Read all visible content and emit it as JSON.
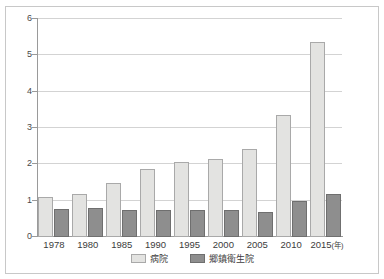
{
  "figure": {
    "title": "",
    "frame_color": "#c8c8c8",
    "background": "#ffffff"
  },
  "legend": {
    "position": "bottom-center",
    "entries": [
      {
        "label": "病院",
        "color": "#e3e3e1"
      },
      {
        "label": "郷鎮衛生院",
        "color": "#8e8e8e"
      }
    ]
  },
  "axis": {
    "y_ticks": [
      "0",
      "1",
      "2",
      "3",
      "4",
      "5",
      "6"
    ],
    "x_unit_label": "(年)"
  },
  "chart_data": {
    "type": "bar",
    "title": "",
    "xlabel": "(年)",
    "ylabel": "",
    "ylim": [
      0,
      6
    ],
    "grid": true,
    "legend_position": "bottom-center",
    "categories": [
      "1978",
      "1980",
      "1985",
      "1990",
      "1995",
      "2000",
      "2005",
      "2010",
      "2015"
    ],
    "series": [
      {
        "name": "病院",
        "color": "#e3e3e1",
        "values": [
          1.09,
          1.19,
          1.49,
          1.87,
          2.07,
          2.16,
          2.43,
          3.37,
          5.38
        ]
      },
      {
        "name": "郷鎮衛生院",
        "color": "#8e8e8e",
        "values": [
          0.76,
          0.79,
          0.73,
          0.73,
          0.74,
          0.75,
          0.68,
          1.0,
          1.18
        ]
      }
    ]
  }
}
